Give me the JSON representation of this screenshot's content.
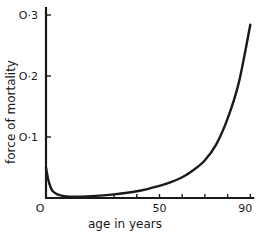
{
  "chart_data": {
    "type": "line",
    "title": "",
    "xlabel": "age in years",
    "ylabel": "force of mortality",
    "xlim": [
      0,
      90
    ],
    "ylim": [
      0,
      0.3
    ],
    "grid": false,
    "legend": null,
    "x_tick_labels": [
      {
        "value": 0,
        "label": "O"
      },
      {
        "value": 50,
        "label": "50"
      },
      {
        "value": 90,
        "label": "90"
      }
    ],
    "x_minor_ticks": [
      30,
      40,
      50,
      60,
      70,
      80,
      90
    ],
    "y_tick_labels": [
      {
        "value": 0.1,
        "label": "O·1"
      },
      {
        "value": 0.2,
        "label": "O·2"
      },
      {
        "value": 0.3,
        "label": "O·3"
      }
    ],
    "series": [
      {
        "name": "force of mortality",
        "x": [
          0,
          1,
          2,
          3,
          5,
          8,
          12,
          20,
          30,
          40,
          50,
          55,
          60,
          65,
          70,
          75,
          80,
          85,
          90
        ],
        "values": [
          0.05,
          0.03,
          0.018,
          0.011,
          0.006,
          0.003,
          0.002,
          0.003,
          0.006,
          0.011,
          0.02,
          0.026,
          0.034,
          0.046,
          0.062,
          0.088,
          0.13,
          0.19,
          0.284
        ]
      }
    ]
  },
  "plot": {
    "origin_px": [
      46,
      198
    ],
    "x_px_per_unit": 2.27,
    "y_px_per_unit": 610,
    "line_color": "#1a1a1a"
  }
}
